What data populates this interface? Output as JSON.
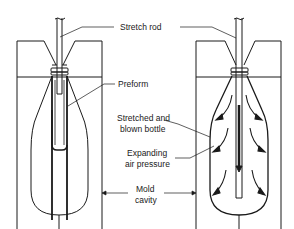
{
  "diagram": {
    "labels": {
      "stretch_rod": "Stretch rod",
      "preform": "Preform",
      "stretched_line1": "Stretched and",
      "stretched_line2": "blown bottle",
      "expanding_line1": "Expanding",
      "expanding_line2": "air pressure",
      "mold_line1": "Mold",
      "mold_line2": "cavity"
    },
    "stages": [
      {
        "name": "preform-stage",
        "description": "Preform in mold with stretch rod"
      },
      {
        "name": "blown-stage",
        "description": "Stretched and blown bottle with air pressure arrows"
      }
    ],
    "colors": {
      "line": "#1a1a1a",
      "background": "#ffffff"
    }
  }
}
